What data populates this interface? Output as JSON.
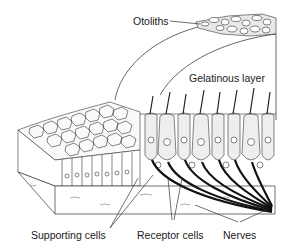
{
  "diagram": {
    "labels": {
      "otoliths": "Otoliths",
      "gelatinous_layer": "Gelatinous layer",
      "supporting_cells": "Supporting cells",
      "receptor_cells": "Receptor cells",
      "nerves": "Nerves"
    },
    "colors": {
      "ink": "#1a1a1a",
      "line": "#555555",
      "background": "#ffffff",
      "cell_fill": "#f4f4f4"
    }
  }
}
